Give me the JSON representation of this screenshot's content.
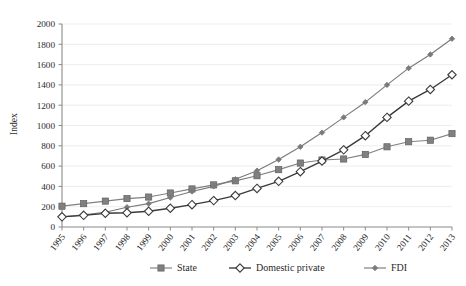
{
  "chart_data": {
    "type": "line",
    "title": "",
    "xlabel": "",
    "ylabel": "Index",
    "ylim": [
      0,
      2000
    ],
    "ytick_step": 200,
    "grid": true,
    "legend_position": "bottom",
    "categories": [
      "1995",
      "1996",
      "1997",
      "1998",
      "1999",
      "2000",
      "2001",
      "2002",
      "2003",
      "2004",
      "2005",
      "2006",
      "2007",
      "2008",
      "2009",
      "2010",
      "2011",
      "2012",
      "2013"
    ],
    "yticks": [
      "0",
      "200",
      "400",
      "600",
      "800",
      "1000",
      "1200",
      "1400",
      "1600",
      "1800",
      "2000"
    ],
    "series": [
      {
        "name": "State",
        "color": "#808080",
        "marker": "filled-square",
        "values": [
          205,
          230,
          255,
          280,
          295,
          335,
          375,
          415,
          455,
          505,
          565,
          630,
          660,
          670,
          715,
          790,
          840,
          855,
          920
        ]
      },
      {
        "name": "Domestic private",
        "color": "#3a3a3a",
        "marker": "open-diamond",
        "values": [
          100,
          115,
          135,
          140,
          155,
          185,
          220,
          260,
          310,
          380,
          450,
          545,
          650,
          760,
          900,
          1080,
          1240,
          1355,
          1500
        ]
      },
      {
        "name": "FDI",
        "color": "#7a7a7a",
        "marker": "small-filled-diamond",
        "values": [
          100,
          120,
          145,
          195,
          230,
          290,
          350,
          400,
          470,
          555,
          665,
          790,
          930,
          1080,
          1230,
          1400,
          1565,
          1700,
          1855
        ]
      }
    ]
  },
  "legend": {
    "items": [
      {
        "label": "State"
      },
      {
        "label": "Domestic private"
      },
      {
        "label": "FDI"
      }
    ]
  },
  "axes": {
    "y_axis_title": "Index"
  }
}
